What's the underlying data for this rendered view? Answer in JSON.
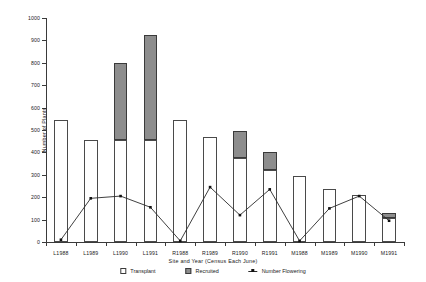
{
  "chart_data": {
    "type": "bar",
    "title": "",
    "xlabel": "Site and Year (Census Each June)",
    "ylabel": "Number of Plants",
    "ylim": [
      0,
      1000
    ],
    "yticks": [
      0,
      100,
      200,
      300,
      400,
      500,
      600,
      700,
      800,
      900,
      1000
    ],
    "grid": false,
    "legend_position": "bottom",
    "stacked": true,
    "categories": [
      "L1988",
      "L1989",
      "L1990",
      "L1991",
      "R1988",
      "R1989",
      "R1990",
      "R1991",
      "M1988",
      "M1989",
      "M1990",
      "M1991"
    ],
    "series": [
      {
        "name": "Transplant",
        "type": "bar",
        "color": "#ffffff",
        "values": [
          545,
          455,
          455,
          455,
          545,
          470,
          375,
          320,
          295,
          235,
          210,
          105
        ]
      },
      {
        "name": "Recruited",
        "type": "bar",
        "color": "#8d8d8d",
        "values": [
          0,
          0,
          345,
          470,
          0,
          0,
          120,
          80,
          0,
          0,
          0,
          25
        ]
      },
      {
        "name": "Number Flowering",
        "type": "line",
        "color": "#2a2a2a",
        "values": [
          10,
          195,
          205,
          155,
          5,
          245,
          120,
          235,
          5,
          150,
          205,
          95
        ]
      }
    ]
  },
  "legend": {
    "items": [
      {
        "label": "Transplant",
        "glyph": "white-square-icon"
      },
      {
        "label": "Recruited",
        "glyph": "gray-square-icon"
      },
      {
        "label": "Number Flowering",
        "glyph": "line-marker-icon"
      }
    ]
  }
}
